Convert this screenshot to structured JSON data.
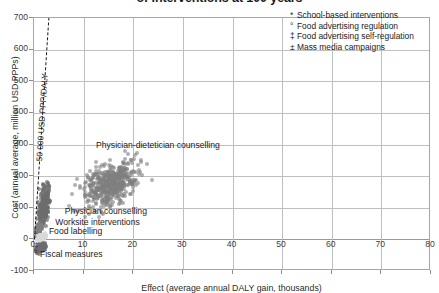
{
  "chart_data": {
    "type": "scatter",
    "title": "of interventions at 100 years",
    "xlabel": "Effect (average annual DALY gain, thousands)",
    "ylabel": "Cost (annual average, million USD PPPs)",
    "xlim": [
      0,
      80
    ],
    "ylim": [
      -100,
      700
    ],
    "xticks": [
      "0",
      "10",
      "20",
      "30",
      "40",
      "50",
      "60",
      "70",
      "80"
    ],
    "yticks": [
      "700",
      "600",
      "500",
      "400",
      "300",
      "200",
      "100",
      "0",
      "-100"
    ],
    "grid": "both",
    "legend_position": "top-right",
    "threshold": {
      "label": "50 000 USD PPP/DALY",
      "slope_usd_per_daly": 50000,
      "x_start": 0,
      "y_start": 0,
      "x_end": 2.9,
      "y_end": 700
    },
    "annotations": [
      {
        "text": "Physician-dietetician counselling",
        "x": 12.5,
        "y": 295
      },
      {
        "text": "Physician counselling",
        "x": 6.2,
        "y": 85
      },
      {
        "text": "Worksite interventions",
        "x": 4.3,
        "y": 52
      },
      {
        "text": "Food labelling",
        "x": 3.0,
        "y": 22
      },
      {
        "text": "Fiscal measures",
        "x": 1.2,
        "y": -48
      }
    ],
    "series": [
      {
        "name": "Physician-dietetician counselling",
        "marker": "dot",
        "color": "#7f7f7f",
        "center": [
          15.5,
          175
        ],
        "spread": [
          4.6,
          55
        ],
        "n": 520
      },
      {
        "name": "Physician counselling",
        "marker": "dot",
        "color": "#6e6e6e",
        "center": [
          2.0,
          105
        ],
        "spread": [
          0.85,
          48
        ],
        "n": 260
      },
      {
        "name": "Worksite interventions",
        "marker": "dot",
        "color": "#7f7f7f",
        "center": [
          0.9,
          28
        ],
        "spread": [
          0.5,
          18
        ],
        "n": 120
      },
      {
        "name": "Food labelling",
        "marker": "dot",
        "color": "#d9d9d9",
        "center": [
          1.5,
          8
        ],
        "spread": [
          0.7,
          7
        ],
        "n": 90
      },
      {
        "name": "Fiscal measures",
        "marker": "dot",
        "color": "#6e6e6e",
        "center": [
          1.4,
          -28
        ],
        "spread": [
          0.8,
          14
        ],
        "n": 110
      }
    ],
    "symbol_markers": [
      {
        "symbol": "*",
        "x": 0.35,
        "y": 15
      },
      {
        "symbol": "°",
        "x": 0.3,
        "y": 2
      },
      {
        "symbol": "‡",
        "x": 0.45,
        "y": -18
      },
      {
        "symbol": "±",
        "x": 0.3,
        "y": -36
      }
    ]
  },
  "legend": {
    "items": [
      {
        "mark": "*",
        "label": "School-based interventions"
      },
      {
        "mark": "°",
        "label": "Food advertising regulation"
      },
      {
        "mark": "‡",
        "label": "Food advertising self-regulation"
      },
      {
        "mark": "±",
        "label": "Mass media campaigns"
      }
    ]
  }
}
